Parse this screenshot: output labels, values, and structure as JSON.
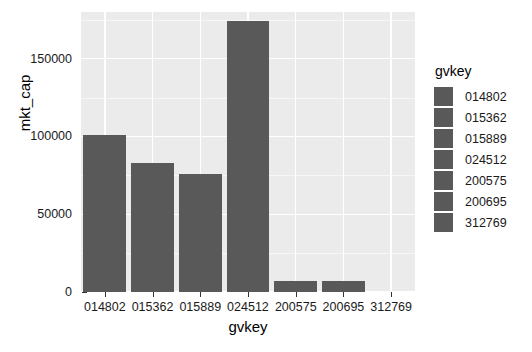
{
  "chart_data": {
    "type": "bar",
    "title": "",
    "subtitle": "",
    "xlabel": "gvkey",
    "ylabel": "mkt_cap",
    "categories": [
      "014802",
      "015362",
      "015889",
      "024512",
      "200575",
      "200695",
      "312769"
    ],
    "values": [
      101000,
      83000,
      76000,
      174500,
      7400,
      7400,
      0
    ],
    "ylim": [
      0,
      180000
    ],
    "ytick_labels": [
      "0",
      "50000",
      "100000",
      "150000"
    ],
    "ytick_values": [
      0,
      50000,
      100000,
      150000
    ],
    "grid": true,
    "legend": {
      "position": "right",
      "title": "gvkey",
      "entries": [
        "014802",
        "015362",
        "015889",
        "024512",
        "200575",
        "200695",
        "312769"
      ]
    },
    "colors": {
      "bar_fill": "#595959",
      "panel_background": "#ebebeb",
      "gridline": "#ffffff",
      "plot_background": "#ffffff",
      "text": "#1a1a1a"
    }
  }
}
